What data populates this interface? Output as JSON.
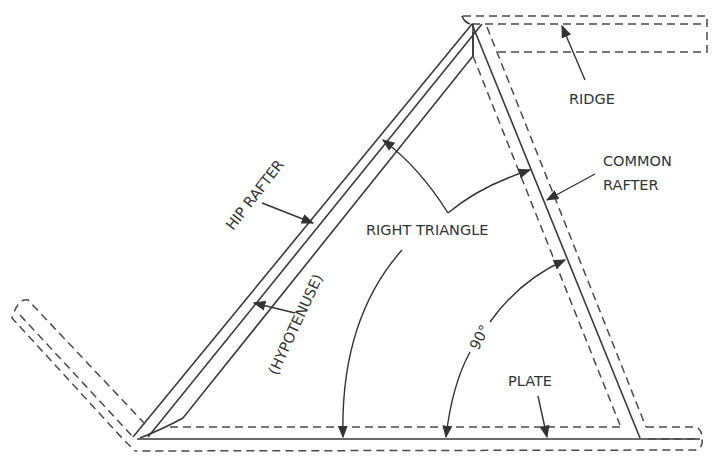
{
  "diagram": {
    "labels": {
      "ridge": "RIDGE",
      "common_rafter_line1": "COMMON",
      "common_rafter_line2": "RAFTER",
      "hip_rafter": "HIP RAFTER",
      "right_triangle": "RIGHT TRIANGLE",
      "hypotenuse": "(HYPOTENUSE)",
      "angle": "90°",
      "plate": "PLATE"
    },
    "colors": {
      "line": "#3a3a3a",
      "background": "#ffffff"
    }
  }
}
